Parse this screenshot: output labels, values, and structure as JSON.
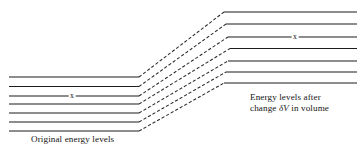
{
  "figure": {
    "background_color": "#ffffff",
    "line_color": "#1c1c1c",
    "dashed_color": "#2a2a2a",
    "width": 364,
    "height": 155
  },
  "captions": {
    "left": "Original energy levels",
    "right_line1": "Energy levels after",
    "right_line2_prefix": "change ",
    "right_line2_symbol": "δV",
    "right_line2_suffix": " in volume"
  },
  "markers": {
    "left_cross": "x",
    "right_cross": "x"
  },
  "chart_data": {
    "type": "line",
    "xlabel": "",
    "ylabel": "",
    "grid": false,
    "legend_position": "none",
    "level_count": 7,
    "left_segment": {
      "x_start": 9,
      "x_end": 139,
      "y_values": [
        77,
        86.5,
        96,
        104,
        113,
        122,
        131
      ]
    },
    "right_segment": {
      "x_end": 357,
      "x_starts": [
        224,
        226,
        228,
        230,
        228,
        226,
        224
      ],
      "y_values": [
        12,
        24,
        37,
        48.5,
        61,
        72,
        83
      ]
    },
    "connectors": [
      {
        "index": 0,
        "from_x": 139,
        "from_y": 77,
        "to_x": 224,
        "to_y": 12
      },
      {
        "index": 1,
        "from_x": 139,
        "from_y": 86.5,
        "to_x": 226,
        "to_y": 24
      },
      {
        "index": 2,
        "from_x": 139,
        "from_y": 96,
        "to_x": 228,
        "to_y": 37
      },
      {
        "index": 3,
        "from_x": 139,
        "from_y": 104,
        "to_x": 230,
        "to_y": 48.5
      },
      {
        "index": 4,
        "from_x": 139,
        "from_y": 113,
        "to_x": 228,
        "to_y": 61
      },
      {
        "index": 5,
        "from_x": 139,
        "from_y": 122,
        "to_x": 226,
        "to_y": 72
      },
      {
        "index": 6,
        "from_x": 139,
        "from_y": 131,
        "to_x": 224,
        "to_y": 83
      }
    ],
    "marked_level_index": 2,
    "marker_positions": {
      "left": {
        "x": 72,
        "y": 96
      },
      "right": {
        "x": 295,
        "y": 37
      }
    }
  }
}
